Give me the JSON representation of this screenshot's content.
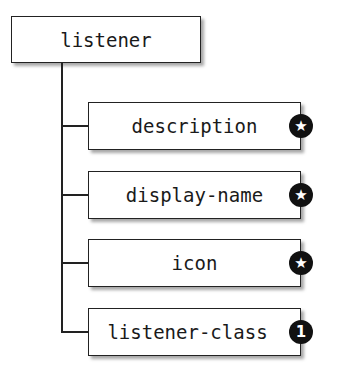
{
  "diagram": {
    "root": {
      "label": "listener"
    },
    "children": [
      {
        "label": "description",
        "badge": "★",
        "badge_meaning": "star"
      },
      {
        "label": "display-name",
        "badge": "★",
        "badge_meaning": "star"
      },
      {
        "label": "icon",
        "badge": "★",
        "badge_meaning": "star"
      },
      {
        "label": "listener-class",
        "badge": "1",
        "badge_meaning": "one"
      }
    ]
  }
}
